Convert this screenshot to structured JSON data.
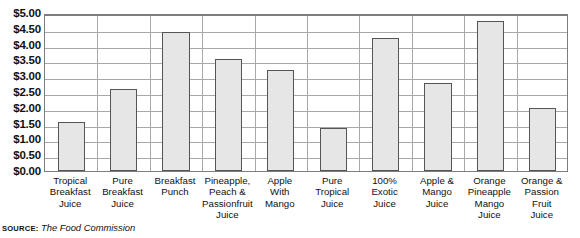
{
  "chart_data": {
    "type": "bar",
    "title": "",
    "xlabel": "",
    "ylabel": "",
    "ylim": [
      0,
      5
    ],
    "ytick_step": 0.5,
    "ytick_prefix": "$",
    "grid": true,
    "legend": null,
    "categories": [
      "Tropical\nBreakfast\nJuice",
      "Pure\nBreakfast\nJuice",
      "Breakfast\nPunch",
      "Pineapple,\nPeach &\nPassionfruit\nJuice",
      "Apple\nWith\nMango",
      "Pure\nTropical\nJuice",
      "100%\nExotic\nJuice",
      "Apple &\nMango\nJuice",
      "Orange\nPineapple\nMango\nJuice",
      "Orange &\nPassion\nFruit\nJuice"
    ],
    "values": [
      1.55,
      2.6,
      4.4,
      3.55,
      3.2,
      1.35,
      4.2,
      2.8,
      4.75,
      2.0
    ],
    "ytick_labels": [
      "$0.00",
      "$0.50",
      "$1.00",
      "$1.50",
      "$2.00",
      "$2.50",
      "$3.00",
      "$3.50",
      "$4.00",
      "$4.50",
      "$5.00"
    ],
    "ytick_values": [
      0,
      0.5,
      1,
      1.5,
      2,
      2.5,
      3,
      3.5,
      4,
      4.5,
      5
    ]
  },
  "footer": {
    "source_label": "Source:",
    "source_name": "The Food Commission"
  },
  "colors": {
    "bar_fill": "#e6e6e6",
    "bar_border": "#555555",
    "gridline": "#a8a8a8",
    "axis": "#7d7d7d",
    "text": "#111111"
  }
}
